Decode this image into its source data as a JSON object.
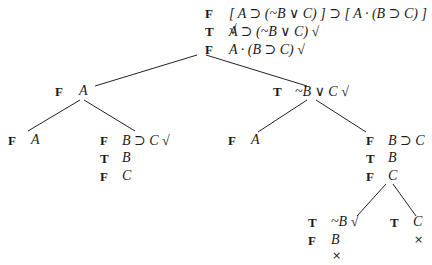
{
  "tree": {
    "root": {
      "lines": [
        {
          "value": "F",
          "formula": "[ A ⊃ (~B ∨ C) ] ⊃ [ A · (B ⊃ C) ] √"
        },
        {
          "value": "T",
          "formula": "A ⊃ (~B ∨ C) √"
        },
        {
          "value": "F",
          "formula": "A · (B ⊃ C) √"
        }
      ]
    },
    "left": {
      "lines": [
        {
          "value": "F",
          "formula": "A"
        }
      ],
      "left": {
        "lines": [
          {
            "value": "F",
            "formula": "A"
          }
        ]
      },
      "right": {
        "lines": [
          {
            "value": "F",
            "formula": "B ⊃ C √"
          },
          {
            "value": "T",
            "formula": "B"
          },
          {
            "value": "F",
            "formula": "C"
          }
        ]
      }
    },
    "right": {
      "lines": [
        {
          "value": "T",
          "formula": "~B ∨ C √"
        }
      ],
      "left": {
        "lines": [
          {
            "value": "F",
            "formula": "A"
          }
        ]
      },
      "right": {
        "lines": [
          {
            "value": "F",
            "formula": "B ⊃ C"
          },
          {
            "value": "T",
            "formula": "B"
          },
          {
            "value": "F",
            "formula": "C"
          }
        ],
        "left": {
          "lines": [
            {
              "value": "T",
              "formula": "~B √"
            },
            {
              "value": "F",
              "formula": "B"
            }
          ],
          "closed_mark": "×"
        },
        "right": {
          "lines": [
            {
              "value": "T",
              "formula": "C"
            }
          ],
          "closed_mark": "×"
        }
      }
    }
  }
}
